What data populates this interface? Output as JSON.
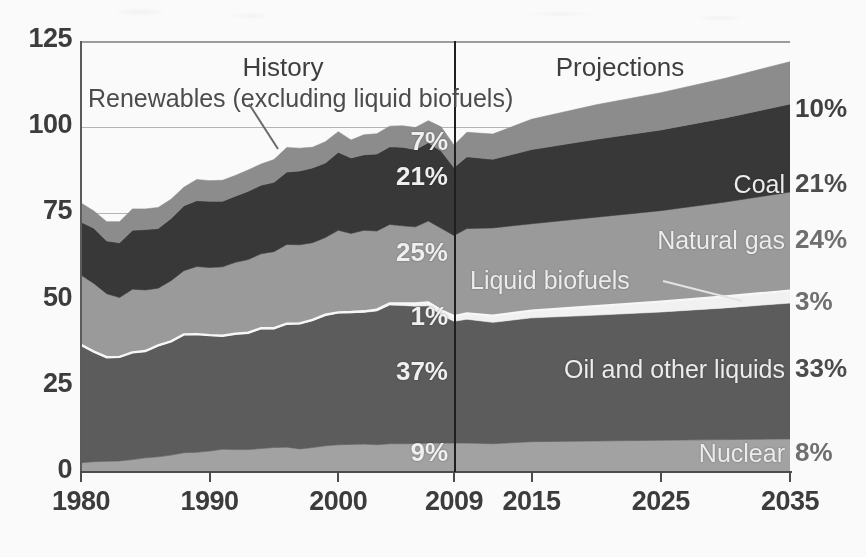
{
  "chart_data": {
    "type": "area",
    "stacked": true,
    "title": "",
    "subtitle": "",
    "xlabel": "",
    "ylabel": "",
    "ylim": [
      0,
      125
    ],
    "yticks": [
      0,
      25,
      50,
      75,
      100,
      125
    ],
    "xlim": [
      1980,
      2035
    ],
    "xticks": [
      1980,
      1990,
      2000,
      2009,
      2015,
      2025,
      2035
    ],
    "xtick_labels": [
      "1980",
      "1990",
      "2000",
      "2009",
      "2015",
      "2025",
      "2035"
    ],
    "grid": true,
    "legend_position": "in-plot-labels",
    "divider_x": 2009,
    "period_labels": [
      {
        "text": "History",
        "x": 2000
      },
      {
        "text": "Projections",
        "x": 2022
      }
    ],
    "annotations": [
      {
        "text": "Renewables (excluding liquid biofuels)",
        "points_to_x": 1999,
        "points_to_y": 92
      },
      {
        "text": "Liquid biofuels",
        "points_to_x": 2022,
        "points_to_y": 48
      }
    ],
    "x": [
      1980,
      1981,
      1982,
      1983,
      1984,
      1985,
      1986,
      1987,
      1988,
      1989,
      1990,
      1991,
      1992,
      1993,
      1994,
      1995,
      1996,
      1997,
      1998,
      1999,
      2000,
      2001,
      2002,
      2003,
      2004,
      2005,
      2006,
      2007,
      2008,
      2009,
      2010,
      2012,
      2015,
      2020,
      2025,
      2030,
      2035
    ],
    "series": [
      {
        "name": "Nuclear",
        "order": 1,
        "color": "#a3a3a3",
        "label": "Nuclear",
        "pct_2009": "9%",
        "pct_2035": "8%",
        "values": [
          2.7,
          3.0,
          3.1,
          3.2,
          3.6,
          4.1,
          4.4,
          4.9,
          5.6,
          5.7,
          6.1,
          6.6,
          6.5,
          6.5,
          6.8,
          7.1,
          7.2,
          6.7,
          7.1,
          7.6,
          7.9,
          8.0,
          8.1,
          7.9,
          8.2,
          8.2,
          8.2,
          8.4,
          8.4,
          8.4,
          8.4,
          8.2,
          8.8,
          9.0,
          9.2,
          9.4,
          9.6
        ]
      },
      {
        "name": "Oil and other liquids",
        "order": 2,
        "color": "#5b5b5b",
        "label": "Oil and other liquids",
        "pct_2009": "37%",
        "pct_2035": "33%",
        "values": [
          34.2,
          31.9,
          30.2,
          30.1,
          31.0,
          30.9,
          32.2,
          32.9,
          34.2,
          34.2,
          33.5,
          32.8,
          33.5,
          33.8,
          34.7,
          34.4,
          35.7,
          36.2,
          36.8,
          37.8,
          38.2,
          38.2,
          38.2,
          38.8,
          40.2,
          40.1,
          39.9,
          39.8,
          37.1,
          35.3,
          35.9,
          35.2,
          35.9,
          36.5,
          37.2,
          38.2,
          39.4
        ]
      },
      {
        "name": "Liquid biofuels",
        "order": 3,
        "color": "#f4f4f4",
        "label": "Liquid biofuels",
        "pct_2009": "1%",
        "pct_2035": "3%",
        "values": [
          0.0,
          0.0,
          0.0,
          0.1,
          0.1,
          0.1,
          0.1,
          0.1,
          0.1,
          0.1,
          0.1,
          0.1,
          0.1,
          0.1,
          0.2,
          0.2,
          0.1,
          0.2,
          0.2,
          0.2,
          0.2,
          0.2,
          0.3,
          0.4,
          0.5,
          0.6,
          0.8,
          1.0,
          1.4,
          1.5,
          1.7,
          1.9,
          2.1,
          2.6,
          3.0,
          3.3,
          3.6
        ]
      },
      {
        "name": "Natural gas",
        "order": 4,
        "color": "#9b9b9b",
        "label": "Natural gas",
        "pct_2009": "25%",
        "pct_2035": "24%",
        "values": [
          20.2,
          19.8,
          18.4,
          17.2,
          18.3,
          17.7,
          16.6,
          17.6,
          18.5,
          19.6,
          19.6,
          20.0,
          20.7,
          21.2,
          21.6,
          22.2,
          23.0,
          22.8,
          22.4,
          22.4,
          23.8,
          22.8,
          23.5,
          22.8,
          22.9,
          22.5,
          22.2,
          23.6,
          23.8,
          23.4,
          24.6,
          25.5,
          25.2,
          25.8,
          26.4,
          27.4,
          28.6
        ]
      },
      {
        "name": "Coal",
        "order": 5,
        "color": "#363636",
        "label": "Coal",
        "pct_2009": "21%",
        "pct_2035": "21%",
        "values": [
          15.4,
          16.0,
          15.3,
          15.9,
          17.1,
          17.5,
          17.3,
          18.0,
          18.8,
          19.1,
          19.2,
          19.0,
          19.2,
          19.8,
          19.9,
          20.1,
          21.0,
          21.4,
          21.7,
          21.6,
          22.6,
          21.9,
          21.9,
          22.3,
          22.5,
          22.8,
          22.4,
          22.7,
          22.4,
          19.7,
          20.8,
          19.9,
          21.5,
          22.6,
          23.4,
          24.4,
          25.5
        ]
      },
      {
        "name": "Renewables (excluding liquid biofuels)",
        "order": 6,
        "color": "#8c8c8c",
        "label": "",
        "pct_2009": "7%",
        "pct_2035": "10%",
        "values": [
          5.5,
          5.0,
          5.6,
          6.1,
          6.2,
          6.0,
          6.1,
          5.6,
          5.4,
          6.1,
          6.0,
          6.1,
          6.0,
          6.2,
          6.1,
          6.6,
          7.1,
          6.6,
          6.0,
          6.2,
          6.0,
          5.2,
          5.8,
          5.9,
          6.0,
          6.2,
          6.4,
          6.4,
          7.0,
          6.5,
          7.1,
          7.3,
          8.8,
          10.0,
          10.8,
          11.5,
          12.3
        ]
      }
    ]
  },
  "axis": {
    "ytick_labels": [
      "125",
      "100",
      "75",
      "50",
      "25",
      "0"
    ],
    "ytick_values": [
      125,
      100,
      75,
      50,
      25,
      0
    ],
    "xtick_labels": [
      "1980",
      "1990",
      "2000",
      "2009",
      "2015",
      "2025",
      "2035"
    ]
  },
  "labels": {
    "history": "History",
    "projections": "Projections",
    "renewables_annotation": "Renewables (excluding liquid biofuels)",
    "liquid_biofuels": "Liquid biofuels",
    "coal": "Coal",
    "natural_gas": "Natural gas",
    "oil_and_other_liquids": "Oil and other liquids",
    "nuclear": "Nuclear"
  },
  "percent_labels_2009": {
    "renewables": "7%",
    "coal": "21%",
    "natural_gas": "25%",
    "liquid_biofuels": "1%",
    "oil": "37%",
    "nuclear": "9%"
  },
  "percent_labels_2035": {
    "renewables": "10%",
    "coal": "21%",
    "natural_gas": "24%",
    "liquid_biofuels": "3%",
    "oil": "33%",
    "nuclear": "8%"
  },
  "colors": {
    "renewables": "#8c8c8c",
    "coal": "#363636",
    "natural_gas": "#9b9b9b",
    "liquid_biofuels": "#f4f4f4",
    "oil": "#5b5b5b",
    "nuclear": "#a3a3a3",
    "gridline": "#b6b6b6",
    "axis": "#4a4a4a",
    "divider": "#1c1c1c",
    "tick_text": "#3a3a3a",
    "right_pct_text": "#5d5d5d"
  }
}
